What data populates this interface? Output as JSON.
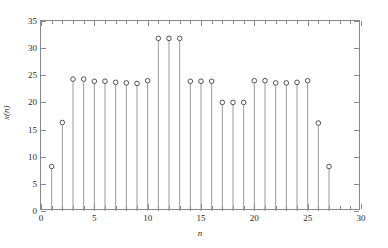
{
  "figure": {
    "background_color": "#ffffff",
    "axis_color": "#8a8a8a",
    "stem_color": "#808080",
    "marker_color": "#404040"
  },
  "axes": {
    "xaxis_title": "n",
    "yaxis_title": "x(n)",
    "x_ticks": [
      "0",
      "5",
      "10",
      "15",
      "20",
      "25",
      "30"
    ],
    "y_ticks": [
      "0",
      "5",
      "10",
      "15",
      "20",
      "25",
      "30",
      "35"
    ]
  },
  "chart_data": {
    "type": "scatter",
    "title": "",
    "subtitle": "",
    "xlabel": "n",
    "ylabel": "x(n)",
    "xlim": [
      0,
      30
    ],
    "ylim": [
      0,
      35
    ],
    "xticks": [
      0,
      5,
      10,
      15,
      20,
      25,
      30
    ],
    "yticks": [
      0,
      5,
      10,
      15,
      20,
      25,
      30,
      35
    ],
    "xminor_ticks": [
      1,
      2,
      3,
      4,
      6,
      7,
      8,
      9,
      11,
      12,
      13,
      14,
      16,
      17,
      18,
      19,
      21,
      22,
      23,
      24,
      26,
      27,
      28,
      29
    ],
    "grid": false,
    "legend": false,
    "marker": "open-circle",
    "stem_baseline": 0,
    "x": [
      1,
      2,
      3,
      4,
      5,
      6,
      7,
      8,
      9,
      10,
      11,
      12,
      13,
      14,
      15,
      16,
      17,
      18,
      19,
      20,
      21,
      22,
      23,
      24,
      25,
      26,
      27
    ],
    "values": [
      8.2,
      16.3,
      24.3,
      24.3,
      23.9,
      23.9,
      23.7,
      23.6,
      23.5,
      24.0,
      31.8,
      31.8,
      31.8,
      23.9,
      23.9,
      23.9,
      20.0,
      20.0,
      20.0,
      24.0,
      24.0,
      23.6,
      23.6,
      23.7,
      24.0,
      16.2,
      8.2
    ]
  }
}
